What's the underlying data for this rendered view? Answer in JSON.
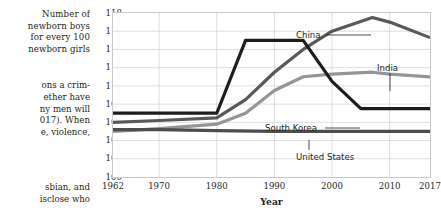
{
  "page": {
    "axis_title_lines": [
      "Number of",
      "newborn boys",
      "for every 100",
      "newborn girls"
    ],
    "body_text_lines": [
      "ons a crim-",
      "ether have",
      "ny men will",
      "017). When",
      "e, violence,"
    ],
    "body_text_lines2": [
      "sbian, and",
      "isclose who"
    ]
  },
  "chart_data": {
    "type": "line",
    "title": "",
    "xlabel": "Year",
    "ylabel": "Number of newborn boys for every 100 newborn girls",
    "xlim": [
      1962,
      2017
    ],
    "ylim": [
      100,
      118
    ],
    "ytick_values": [
      100,
      102,
      104,
      106,
      108,
      110,
      112,
      114,
      116,
      118
    ],
    "ytick_labels": [
      "100",
      "102",
      "104",
      "106",
      "108",
      "110",
      "112",
      "114",
      "116",
      "118"
    ],
    "xtick_values": [
      1962,
      1970,
      1980,
      1990,
      2000,
      2010,
      2017
    ],
    "xtick_labels": [
      "1962",
      "1970",
      "1980",
      "1990",
      "2000",
      "2010",
      "2017"
    ],
    "grid": true,
    "legend_position": "inline-annotations",
    "series": [
      {
        "name": "South Korea",
        "color": "#1d1d1b",
        "x": [
          1962,
          1970,
          1980,
          1985,
          1990,
          1995,
          2000,
          2005,
          2010,
          2017
        ],
        "values": [
          107.0,
          107.0,
          107.0,
          115.0,
          115.0,
          115.0,
          110.5,
          107.5,
          107.5,
          107.5
        ]
      },
      {
        "name": "China",
        "color": "#58595b",
        "x": [
          1962,
          1970,
          1980,
          1985,
          1990,
          1995,
          2000,
          2007,
          2010,
          2017
        ],
        "values": [
          106.0,
          106.2,
          106.5,
          108.5,
          111.5,
          114.0,
          116.0,
          117.5,
          117.0,
          115.3
        ]
      },
      {
        "name": "India",
        "color": "#939598",
        "x": [
          1962,
          1970,
          1980,
          1985,
          1990,
          1995,
          2000,
          2007,
          2010,
          2017
        ],
        "values": [
          105.0,
          105.3,
          105.8,
          107.0,
          109.5,
          111.0,
          111.3,
          111.5,
          111.3,
          111.0
        ]
      },
      {
        "name": "United States",
        "color": "#4d4d4f",
        "x": [
          1962,
          1970,
          1980,
          1990,
          2000,
          2010,
          2017
        ],
        "values": [
          105.2,
          105.2,
          105.1,
          105.0,
          105.0,
          105.0,
          105.0
        ]
      }
    ],
    "annotations": [
      {
        "text": "China",
        "series": "China"
      },
      {
        "text": "India",
        "series": "India"
      },
      {
        "text": "South Korea",
        "series": "South Korea"
      },
      {
        "text": "United States",
        "series": "United States"
      }
    ]
  }
}
